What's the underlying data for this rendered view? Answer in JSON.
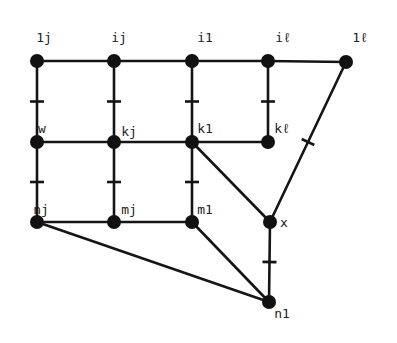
{
  "diagram": {
    "type": "graph",
    "nodes": [
      {
        "id": "1j",
        "label": "1j",
        "x": 37,
        "y": 61,
        "lx": 44,
        "ly": 42
      },
      {
        "id": "ij",
        "label": "ij",
        "x": 114,
        "y": 61,
        "lx": 119,
        "ly": 42
      },
      {
        "id": "i1",
        "label": "i1",
        "x": 192,
        "y": 61,
        "lx": 205,
        "ly": 42
      },
      {
        "id": "il",
        "label": "iℓ",
        "x": 268,
        "y": 61,
        "lx": 283,
        "ly": 42
      },
      {
        "id": "1l",
        "label": "1ℓ",
        "x": 346,
        "y": 62,
        "lx": 360,
        "ly": 42
      },
      {
        "id": "w",
        "label": "w",
        "x": 37,
        "y": 142,
        "lx": 42,
        "ly": 133
      },
      {
        "id": "kj",
        "label": "kj",
        "x": 114,
        "y": 142,
        "lx": 129,
        "ly": 136
      },
      {
        "id": "k1",
        "label": "k1",
        "x": 192,
        "y": 142,
        "lx": 205,
        "ly": 133
      },
      {
        "id": "kl",
        "label": "kℓ",
        "x": 268,
        "y": 142,
        "lx": 282,
        "ly": 133
      },
      {
        "id": "nj",
        "label": "nj",
        "x": 37,
        "y": 222,
        "lx": 41,
        "ly": 214
      },
      {
        "id": "mj",
        "label": "mj",
        "x": 114,
        "y": 222,
        "lx": 129,
        "ly": 214
      },
      {
        "id": "m1",
        "label": "m1",
        "x": 192,
        "y": 222,
        "lx": 205,
        "ly": 214
      },
      {
        "id": "x",
        "label": "x",
        "x": 270,
        "y": 222,
        "lx": 284,
        "ly": 227
      },
      {
        "id": "n1",
        "label": "n1",
        "x": 269,
        "y": 302,
        "lx": 282,
        "ly": 318
      }
    ],
    "edges": [
      {
        "from": "1j",
        "to": "ij",
        "tick": false
      },
      {
        "from": "ij",
        "to": "i1",
        "tick": false
      },
      {
        "from": "i1",
        "to": "il",
        "tick": false
      },
      {
        "from": "il",
        "to": "1l",
        "tick": false
      },
      {
        "from": "1j",
        "to": "w",
        "tick": true
      },
      {
        "from": "ij",
        "to": "kj",
        "tick": true
      },
      {
        "from": "i1",
        "to": "k1",
        "tick": true
      },
      {
        "from": "il",
        "to": "kl",
        "tick": true
      },
      {
        "from": "w",
        "to": "kj",
        "tick": false
      },
      {
        "from": "kj",
        "to": "k1",
        "tick": false
      },
      {
        "from": "k1",
        "to": "kl",
        "tick": false
      },
      {
        "from": "w",
        "to": "nj",
        "tick": true
      },
      {
        "from": "kj",
        "to": "mj",
        "tick": true
      },
      {
        "from": "k1",
        "to": "m1",
        "tick": true
      },
      {
        "from": "nj",
        "to": "mj",
        "tick": false
      },
      {
        "from": "mj",
        "to": "m1",
        "tick": false
      },
      {
        "from": "k1",
        "to": "x",
        "tick": false
      },
      {
        "from": "1l",
        "to": "x",
        "tick": true
      },
      {
        "from": "x",
        "to": "n1",
        "tick": true
      },
      {
        "from": "m1",
        "to": "n1",
        "tick": false
      },
      {
        "from": "nj",
        "to": "n1",
        "tick": false
      }
    ],
    "colors": {
      "ink": "#151515",
      "background": "#ffffff"
    }
  }
}
